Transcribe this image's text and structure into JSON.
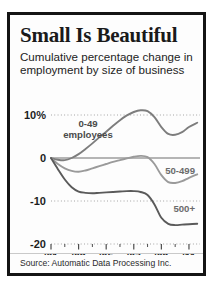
{
  "card": {
    "headline": "Small Is Beautiful",
    "subtitle": "Cumulative percentage change in employment by size of business",
    "source": "Source: Automatic Data Processing Inc."
  },
  "colors": {
    "border": "#141414",
    "background": "#fdfdfd",
    "text": "#1a1a1a",
    "line_small": "#7d7d7d",
    "line_medium": "#9a9a9a",
    "line_large": "#5a5a5a",
    "gridline": "#9b9b9b",
    "zeroline": "#6f6f6f"
  },
  "axis": {
    "y_ticks": [
      "10%",
      "0",
      "-10",
      "-20"
    ],
    "y_values": [
      10,
      0,
      -10,
      -20
    ],
    "x_ticks": [
      "'01",
      "'03",
      "'05",
      "'07",
      "'09",
      "'11"
    ],
    "x_values": [
      2001,
      2003,
      2005,
      2007,
      2009,
      2011
    ]
  },
  "labels": {
    "small": "0-49",
    "small_line2": "employees",
    "medium": "50-499",
    "large": "500+"
  },
  "chart_data": {
    "type": "line",
    "title": "Small Is Beautiful",
    "subtitle": "Cumulative percentage change in employment by size of business",
    "xlabel": "",
    "ylabel": "Cumulative percentage change in employment",
    "xlim": [
      2001,
      2011.8
    ],
    "ylim": [
      -20,
      12
    ],
    "grid": true,
    "legend": "inline-annotations",
    "source": "Source: Automatic Data Processing Inc.",
    "x": [
      2001,
      2001.5,
      2002,
      2002.5,
      2003,
      2003.5,
      2004,
      2004.5,
      2005,
      2005.5,
      2006,
      2006.5,
      2007,
      2007.5,
      2008,
      2008.5,
      2009,
      2009.5,
      2010,
      2010.5,
      2011,
      2011.6
    ],
    "series": [
      {
        "name": "0-49 employees",
        "label": "0-49 employees",
        "color": "#7d7d7d",
        "values": [
          0,
          -0.4,
          -0.5,
          0.0,
          0.9,
          2.1,
          3.4,
          4.8,
          6.1,
          7.5,
          8.8,
          9.9,
          10.7,
          11.1,
          10.9,
          9.5,
          7.2,
          5.6,
          5.4,
          6.0,
          7.2,
          8.2
        ]
      },
      {
        "name": "50-499",
        "label": "50-499",
        "color": "#9a9a9a",
        "values": [
          0,
          -1.4,
          -2.4,
          -3.0,
          -3.2,
          -2.9,
          -2.4,
          -1.9,
          -1.4,
          -0.9,
          -0.5,
          -0.1,
          0.3,
          0.5,
          0.2,
          -1.4,
          -4.0,
          -5.6,
          -5.8,
          -5.4,
          -4.6,
          -3.8
        ]
      },
      {
        "name": "500+",
        "label": "500+",
        "color": "#5a5a5a",
        "values": [
          0,
          -2.6,
          -5.0,
          -6.8,
          -7.8,
          -8.1,
          -8.2,
          -8.1,
          -8.0,
          -7.9,
          -7.8,
          -7.7,
          -7.7,
          -7.9,
          -8.6,
          -10.8,
          -13.9,
          -15.3,
          -15.6,
          -15.5,
          -15.4,
          -15.3
        ]
      }
    ]
  }
}
